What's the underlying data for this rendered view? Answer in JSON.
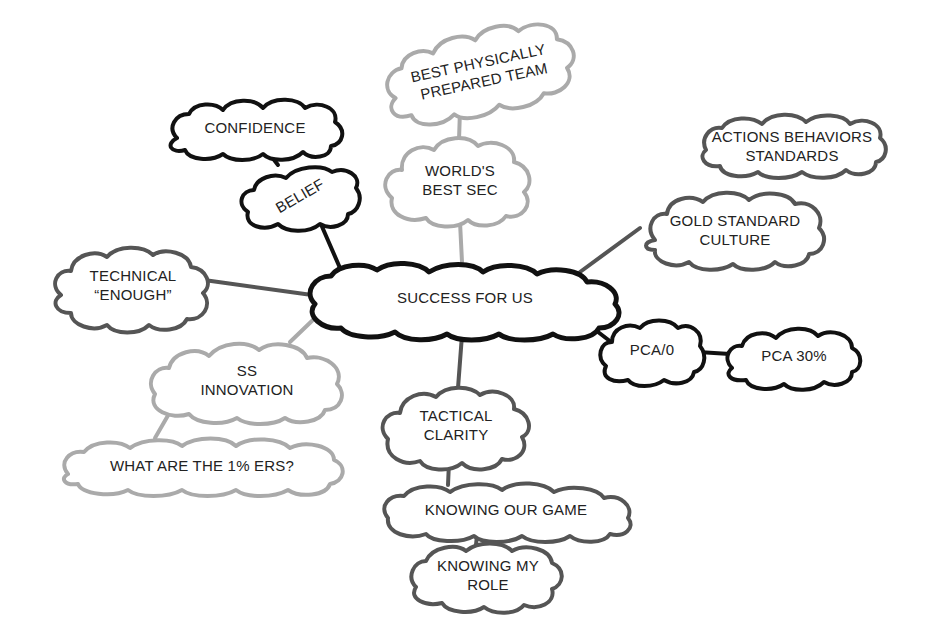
{
  "diagram": {
    "type": "mind-map",
    "colors": {
      "black": "#111111",
      "dark_grey": "#555555",
      "light_grey": "#aaaaaa",
      "background": "#ffffff",
      "text": "#222222"
    },
    "center": {
      "id": "success",
      "lines": [
        "SUCCESS FOR US"
      ]
    },
    "nodes": [
      {
        "id": "best_physically",
        "lines": [
          "BEST PHYSICALLY",
          "PREPARED TEAM"
        ],
        "tone": "light_grey"
      },
      {
        "id": "worlds_best_sec",
        "lines": [
          "WORLD'S",
          "BEST SEC"
        ],
        "tone": "light_grey"
      },
      {
        "id": "confidence",
        "lines": [
          "CONFIDENCE"
        ],
        "tone": "black"
      },
      {
        "id": "belief",
        "lines": [
          "BELIEF"
        ],
        "tone": "black"
      },
      {
        "id": "actions_behaviors",
        "lines": [
          "ACTIONS BEHAVIORS",
          "STANDARDS"
        ],
        "tone": "dark_grey"
      },
      {
        "id": "gold_standard",
        "lines": [
          "GOLD STANDARD",
          "CULTURE"
        ],
        "tone": "dark_grey"
      },
      {
        "id": "technical_enough",
        "lines": [
          "TECHNICAL",
          "“ENOUGH”"
        ],
        "tone": "dark_grey"
      },
      {
        "id": "pca0",
        "lines": [
          "PCA/0"
        ],
        "tone": "black"
      },
      {
        "id": "pca30",
        "lines": [
          "PCA 30%"
        ],
        "tone": "black"
      },
      {
        "id": "ss_innovation",
        "lines": [
          "SS",
          "INNOVATION"
        ],
        "tone": "light_grey"
      },
      {
        "id": "one_percenters",
        "lines": [
          "WHAT ARE THE 1% ERS?"
        ],
        "tone": "light_grey"
      },
      {
        "id": "tactical_clarity",
        "lines": [
          "TACTICAL",
          "CLARITY"
        ],
        "tone": "dark_grey"
      },
      {
        "id": "knowing_game",
        "lines": [
          "KNOWING OUR GAME"
        ],
        "tone": "dark_grey"
      },
      {
        "id": "knowing_role",
        "lines": [
          "KNOWING MY",
          "ROLE"
        ],
        "tone": "dark_grey"
      }
    ],
    "edges": [
      {
        "from": "success",
        "to": "worlds_best_sec",
        "tone": "light_grey"
      },
      {
        "from": "worlds_best_sec",
        "to": "best_physically",
        "tone": "light_grey"
      },
      {
        "from": "success",
        "to": "belief",
        "tone": "black"
      },
      {
        "from": "belief",
        "to": "confidence",
        "tone": "black"
      },
      {
        "from": "success",
        "to": "gold_standard",
        "tone": "dark_grey"
      },
      {
        "from": "success",
        "to": "technical_enough",
        "tone": "dark_grey"
      },
      {
        "from": "success",
        "to": "pca0",
        "tone": "black"
      },
      {
        "from": "pca0",
        "to": "pca30",
        "tone": "black"
      },
      {
        "from": "success",
        "to": "ss_innovation",
        "tone": "light_grey"
      },
      {
        "from": "ss_innovation",
        "to": "one_percenters",
        "tone": "light_grey"
      },
      {
        "from": "success",
        "to": "tactical_clarity",
        "tone": "dark_grey"
      },
      {
        "from": "tactical_clarity",
        "to": "knowing_game",
        "tone": "dark_grey"
      },
      {
        "from": "knowing_game",
        "to": "knowing_role",
        "tone": "dark_grey"
      }
    ]
  }
}
